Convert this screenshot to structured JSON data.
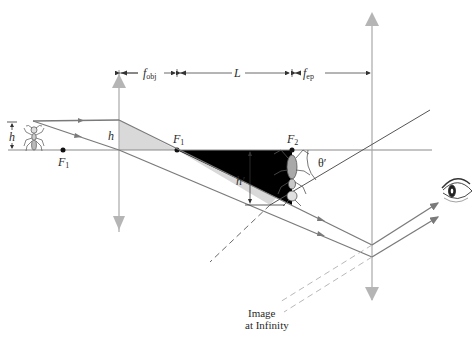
{
  "diagram": {
    "labels": {
      "f_obj_main": "f",
      "f_obj_sub": "obj",
      "L": "L",
      "f_ep_main": "f",
      "f_ep_sub": "ep",
      "h_object": "h",
      "h_lens": "h",
      "h_image": "h′",
      "F1_left_main": "F",
      "F1_left_sub": "1",
      "F1_right_main": "F",
      "F1_right_sub": "1",
      "F2_main": "F",
      "F2_sub": "2",
      "theta": "θ′",
      "image_line1": "Image",
      "image_line2": "at Infinity"
    },
    "elements": {
      "objective_lens": "objective lens",
      "eyepiece_lens": "eyepiece lens",
      "object": "ant",
      "intermediate_image": "inverted ant image",
      "observer": "eye"
    },
    "colors": {
      "ray": "#7a7a7a",
      "axis": "#8a8a8a",
      "lens": "#a8a8a8",
      "lens_arrow": "#b5b5b5",
      "shade": "#d9d9d9",
      "dim": "#555555",
      "dashed": "#6a6a6a",
      "dashed_light": "#b8b8b8",
      "point": "#111111"
    }
  }
}
